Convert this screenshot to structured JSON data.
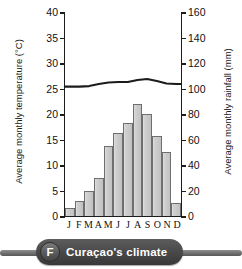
{
  "caption": {
    "badge_letter": "F",
    "text": "Curaçao's climate"
  },
  "chart_data": {
    "type": "bar",
    "title": "Curaçao's climate",
    "xlabel": "",
    "categories": [
      "J",
      "F",
      "M",
      "A",
      "M",
      "J",
      "J",
      "A",
      "S",
      "O",
      "N",
      "D"
    ],
    "grid": false,
    "legend": "none",
    "axes": {
      "left": {
        "label": "Average monthly temperature (°C)",
        "min": 0,
        "max": 40,
        "step": 5,
        "ticks": [
          "0",
          "5",
          "10",
          "15",
          "20",
          "25",
          "30",
          "35",
          "40"
        ]
      },
      "right": {
        "label": "Average monthly rainfall (mm)",
        "min": 0,
        "max": 160,
        "step": 20,
        "ticks": [
          "0",
          "20",
          "40",
          "60",
          "80",
          "100",
          "120",
          "140",
          "160"
        ]
      }
    },
    "series": [
      {
        "name": "Average monthly rainfall",
        "type": "bar",
        "axis": "right",
        "unit": "mm",
        "values": [
          6,
          12,
          20,
          30,
          55,
          65,
          73,
          88,
          80,
          63,
          50,
          10
        ]
      },
      {
        "name": "Average monthly temperature",
        "type": "line",
        "axis": "left",
        "unit": "°C",
        "values": [
          25.5,
          25.5,
          25.6,
          26.0,
          26.3,
          26.4,
          26.4,
          26.8,
          27.0,
          26.6,
          26.1,
          26.0
        ]
      }
    ]
  }
}
